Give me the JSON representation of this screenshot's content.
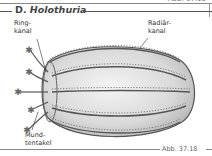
{
  "figure": {
    "top_caption": "Abb. 37.18",
    "section_prefix": "D.",
    "section_title": "Holothuria",
    "labels": {
      "ringkanal_1": "Ring-",
      "ringkanal_2": "kanal",
      "radiaerkanal_1": "Radiär-",
      "radiaerkanal_2": "kanal",
      "mundtentakel_1": "Mund-",
      "mundtentakel_2": "tentakel"
    },
    "bottom_caption": "Abb. 37.18"
  }
}
